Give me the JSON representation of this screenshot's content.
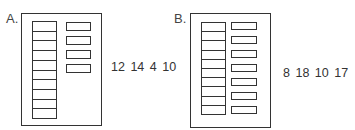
{
  "panels": [
    {
      "label": "A.",
      "left_cells": 10,
      "right_slots": 4,
      "numbers": "12 14 4 10"
    },
    {
      "label": "B.",
      "left_cells": 10,
      "right_slots": 7,
      "numbers": "8 18 10 17"
    }
  ]
}
